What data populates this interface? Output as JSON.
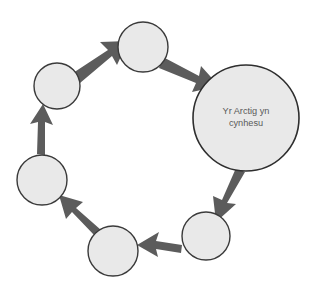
{
  "diagram": {
    "type": "cycle-diagram",
    "title": "",
    "background_color": "#ffffff",
    "node_fill_color": "#e9e9e9",
    "node_stroke_color": "#3a3a3a",
    "arrow_color": "#5c5c5c",
    "label_color": "#5a5a5a",
    "direction": "clockwise",
    "node_count": 6,
    "arrow_count": 6,
    "nodes": [
      {
        "id": "node-large",
        "label": "Yr Arctig yn cynhesu",
        "label_line1": "Yr Arctig yn",
        "label_line2": "cynhesu",
        "cx": 246,
        "cy": 118,
        "r": 53,
        "size": "large",
        "has_label": true
      },
      {
        "id": "node-bottom-right",
        "label": "",
        "cx": 206,
        "cy": 236,
        "r": 24,
        "size": "small",
        "has_label": false
      },
      {
        "id": "node-bottom-left",
        "label": "",
        "cx": 113,
        "cy": 251,
        "r": 25,
        "size": "small",
        "has_label": false
      },
      {
        "id": "node-mid-left",
        "label": "",
        "cx": 42,
        "cy": 180,
        "r": 25,
        "size": "small",
        "has_label": false
      },
      {
        "id": "node-upper-left",
        "label": "",
        "cx": 57,
        "cy": 86,
        "r": 23,
        "size": "small",
        "has_label": false
      },
      {
        "id": "node-top",
        "label": "",
        "cx": 143,
        "cy": 47,
        "r": 25,
        "size": "small",
        "has_label": false
      }
    ],
    "arrows": [
      {
        "id": "arrow-top-to-large",
        "from": "node-top",
        "to": "node-large",
        "direction": "down-right"
      },
      {
        "id": "arrow-large-to-bottom-right",
        "from": "node-large",
        "to": "node-bottom-right",
        "direction": "down-left"
      },
      {
        "id": "arrow-bottom-right-to-bottom-left",
        "from": "node-bottom-right",
        "to": "node-bottom-left",
        "direction": "left"
      },
      {
        "id": "arrow-bottom-left-to-mid-left",
        "from": "node-bottom-left",
        "to": "node-mid-left",
        "direction": "up-left"
      },
      {
        "id": "arrow-mid-left-to-upper-left",
        "from": "node-mid-left",
        "to": "node-upper-left",
        "direction": "up"
      },
      {
        "id": "arrow-upper-left-to-top",
        "from": "node-upper-left",
        "to": "node-top",
        "direction": "up-right"
      }
    ]
  }
}
